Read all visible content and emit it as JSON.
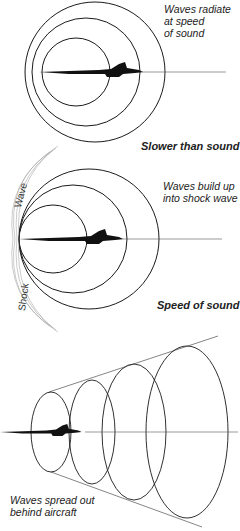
{
  "diagram": {
    "panels": [
      {
        "id": "subsonic",
        "caption": "Slower than sound",
        "note_lines": [
          "Waves radiate",
          "at speed",
          "of sound"
        ]
      },
      {
        "id": "sonic",
        "caption": "Speed of sound",
        "note_lines": [
          "Waves build up",
          "into shock wave"
        ],
        "shock_labels": {
          "upper": "Wave",
          "lower": "Shock"
        }
      },
      {
        "id": "supersonic",
        "caption": "",
        "note_lines": [
          "Waves spread out",
          "behind aircraft"
        ]
      }
    ],
    "colors": {
      "line": "#1a1a1a",
      "aircraft": "#111111",
      "shock": "#888888",
      "background": "#ffffff"
    }
  }
}
